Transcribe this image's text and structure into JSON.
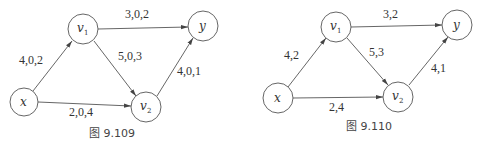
{
  "figures": [
    {
      "caption": "图 9.109",
      "nodes": [
        {
          "id": "x",
          "label": "x",
          "sub": ""
        },
        {
          "id": "v1",
          "label": "v",
          "sub": "1"
        },
        {
          "id": "v2",
          "label": "v",
          "sub": "2"
        },
        {
          "id": "y",
          "label": "y",
          "sub": ""
        }
      ],
      "edges": [
        {
          "from": "x",
          "to": "v1",
          "label": "4,0,2"
        },
        {
          "from": "v1",
          "to": "y",
          "label": "3,0,2"
        },
        {
          "from": "v1",
          "to": "v2",
          "label": "5,0,3"
        },
        {
          "from": "v2",
          "to": "y",
          "label": "4,0,1"
        },
        {
          "from": "x",
          "to": "v2",
          "label": "2,0,4"
        }
      ]
    },
    {
      "caption": "图 9.110",
      "nodes": [
        {
          "id": "x",
          "label": "x",
          "sub": ""
        },
        {
          "id": "v1",
          "label": "v",
          "sub": "1"
        },
        {
          "id": "v2",
          "label": "v",
          "sub": "2"
        },
        {
          "id": "y",
          "label": "y",
          "sub": ""
        }
      ],
      "edges": [
        {
          "from": "x",
          "to": "v1",
          "label": "4,2"
        },
        {
          "from": "v1",
          "to": "y",
          "label": "3,2"
        },
        {
          "from": "v1",
          "to": "v2",
          "label": "5,3"
        },
        {
          "from": "v2",
          "to": "y",
          "label": "4,1"
        },
        {
          "from": "x",
          "to": "v2",
          "label": "2,4"
        }
      ]
    }
  ]
}
